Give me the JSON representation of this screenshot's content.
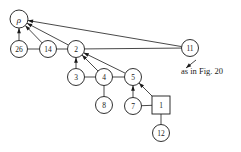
{
  "figure": {
    "caption": "as in Fig. 20",
    "colors": {
      "stroke": "#1a1a1a",
      "fill": "#ffffff",
      "background": "#ffffff"
    },
    "nodes": [
      {
        "id": "rho",
        "label": "ρ",
        "shape": "circle",
        "x": 19,
        "y": 19,
        "r": 9,
        "italic": true
      },
      {
        "id": "n26",
        "label": "26",
        "shape": "circle",
        "x": 19,
        "y": 49,
        "r": 8.5,
        "italic": false
      },
      {
        "id": "n14",
        "label": "14",
        "shape": "circle",
        "x": 48,
        "y": 49,
        "r": 8.5,
        "italic": false
      },
      {
        "id": "n2",
        "label": "2",
        "shape": "circle",
        "x": 76,
        "y": 49,
        "r": 8.5,
        "italic": false
      },
      {
        "id": "n11",
        "label": "11",
        "shape": "circle",
        "x": 190,
        "y": 48,
        "r": 8.5,
        "italic": false
      },
      {
        "id": "n3",
        "label": "3",
        "shape": "circle",
        "x": 76,
        "y": 77,
        "r": 8.5,
        "italic": false
      },
      {
        "id": "n4",
        "label": "4",
        "shape": "circle",
        "x": 104,
        "y": 77,
        "r": 8.5,
        "italic": false
      },
      {
        "id": "n5",
        "label": "5",
        "shape": "circle",
        "x": 133,
        "y": 77,
        "r": 8.5,
        "italic": false
      },
      {
        "id": "n8",
        "label": "8",
        "shape": "circle",
        "x": 104,
        "y": 105,
        "r": 8.5,
        "italic": false
      },
      {
        "id": "n7",
        "label": "7",
        "shape": "circle",
        "x": 133,
        "y": 106,
        "r": 8.5,
        "italic": false
      },
      {
        "id": "n1",
        "label": "1",
        "shape": "square",
        "x": 161,
        "y": 105,
        "r": 9,
        "italic": false
      },
      {
        "id": "n12",
        "label": "12",
        "shape": "circle",
        "x": 161,
        "y": 133,
        "r": 8.5,
        "italic": false
      }
    ],
    "edges": [
      {
        "from": "n26",
        "to": "rho",
        "arrow": true
      },
      {
        "from": "n14",
        "to": "rho",
        "arrow": true
      },
      {
        "from": "n2",
        "to": "rho",
        "arrow": true
      },
      {
        "from": "n11",
        "to": "rho",
        "arrow": true
      },
      {
        "from": "n26",
        "to": "n14",
        "arrow": false
      },
      {
        "from": "n14",
        "to": "n2",
        "arrow": false
      },
      {
        "from": "n2",
        "to": "n11",
        "arrow": false
      },
      {
        "from": "n3",
        "to": "n2",
        "arrow": true
      },
      {
        "from": "n4",
        "to": "n2",
        "arrow": true
      },
      {
        "from": "n5",
        "to": "n2",
        "arrow": true
      },
      {
        "from": "n3",
        "to": "n4",
        "arrow": false
      },
      {
        "from": "n4",
        "to": "n5",
        "arrow": false
      },
      {
        "from": "n4",
        "to": "n8",
        "arrow": false
      },
      {
        "from": "n7",
        "to": "n5",
        "arrow": true
      },
      {
        "from": "n1",
        "to": "n5",
        "arrow": true
      },
      {
        "from": "n7",
        "to": "n1",
        "arrow": false
      },
      {
        "from": "n1",
        "to": "n12",
        "arrow": false
      }
    ],
    "caption_pointer": {
      "x1": 196,
      "y1": 60,
      "x2": 186,
      "y2": 68
    },
    "caption_position": {
      "x": 181,
      "y": 71
    }
  }
}
